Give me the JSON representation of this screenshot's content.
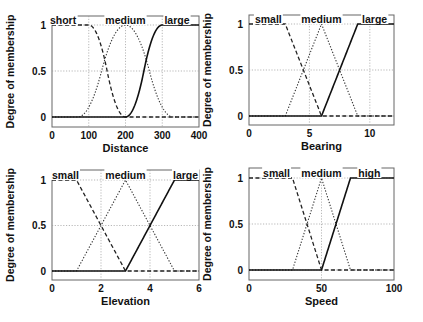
{
  "chart_data": [
    {
      "type": "line",
      "title": "",
      "xlabel": "Distance",
      "ylabel": "Degree of membership",
      "xlim": [
        0,
        400
      ],
      "ylim": [
        0,
        1
      ],
      "xticks": [
        0,
        100,
        200,
        300,
        400
      ],
      "yticks": [
        0,
        0.5,
        1
      ],
      "ytick_labels": [
        "0",
        "0.5",
        "1"
      ],
      "grid": true,
      "series": [
        {
          "name": "short",
          "style": "dashed",
          "shape": "zmf",
          "params": [
            100,
            200
          ],
          "label_x": 30
        },
        {
          "name": "medium",
          "style": "dotted",
          "shape": "gbell-like",
          "params": [
            100,
            200,
            300
          ],
          "label_x": 200
        },
        {
          "name": "large",
          "style": "solid",
          "shape": "smf",
          "params": [
            200,
            300
          ],
          "label_x": 340
        }
      ]
    },
    {
      "type": "line",
      "title": "",
      "xlabel": "Bearing",
      "ylabel": "Degree of membership",
      "xlim": [
        0,
        12
      ],
      "ylim": [
        0,
        1
      ],
      "xticks": [
        0,
        5,
        10
      ],
      "yticks": [
        0,
        0.5,
        1
      ],
      "ytick_labels": [
        "0",
        "0.5",
        "1"
      ],
      "grid": true,
      "series": [
        {
          "name": "small",
          "style": "dashed",
          "shape": "trapmf",
          "params": [
            0,
            0,
            3,
            6
          ],
          "label_x": 1.6
        },
        {
          "name": "medium",
          "style": "dotted",
          "shape": "trimf",
          "params": [
            3,
            6,
            9
          ],
          "label_x": 6
        },
        {
          "name": "large",
          "style": "solid",
          "shape": "trapmf",
          "params": [
            6,
            9,
            12,
            12
          ],
          "label_x": 10.4
        }
      ]
    },
    {
      "type": "line",
      "title": "",
      "xlabel": "Elevation",
      "ylabel": "Degree of membership",
      "xlim": [
        0,
        6
      ],
      "ylim": [
        0,
        1
      ],
      "xticks": [
        0,
        2,
        4,
        6
      ],
      "yticks": [
        0,
        0.5,
        1
      ],
      "ytick_labels": [
        "0",
        "0.5",
        "1"
      ],
      "grid": true,
      "series": [
        {
          "name": "small",
          "style": "dashed",
          "shape": "trapmf",
          "params": [
            0,
            0,
            1,
            3
          ],
          "label_x": 0.55
        },
        {
          "name": "medium",
          "style": "dotted",
          "shape": "trimf",
          "params": [
            1,
            3,
            5
          ],
          "label_x": 3
        },
        {
          "name": "large",
          "style": "solid",
          "shape": "trapmf",
          "params": [
            3,
            5,
            6,
            6
          ],
          "label_x": 5.45
        }
      ]
    },
    {
      "type": "line",
      "title": "",
      "xlabel": "Speed",
      "ylabel": "Degree of membership",
      "xlim": [
        0,
        100
      ],
      "ylim": [
        0,
        1
      ],
      "xticks": [
        0,
        50,
        100
      ],
      "yticks": [
        0,
        0.5,
        1
      ],
      "ytick_labels": [
        "0",
        "0.5",
        "1"
      ],
      "grid": true,
      "series": [
        {
          "name": "small",
          "style": "dashed",
          "shape": "trapmf",
          "params": [
            0,
            0,
            30,
            50
          ],
          "label_x": 19
        },
        {
          "name": "medium",
          "style": "dotted",
          "shape": "trimf",
          "params": [
            30,
            50,
            70
          ],
          "label_x": 50
        },
        {
          "name": "high",
          "style": "solid",
          "shape": "trapmf",
          "params": [
            50,
            70,
            100,
            100
          ],
          "label_x": 83
        }
      ]
    }
  ],
  "layout": {
    "panels": [
      {
        "box": [
          52,
          16,
          199,
          127
        ],
        "y0": 117,
        "y1": 25
      },
      {
        "box": [
          249,
          15,
          394,
          125
        ],
        "y0": 116,
        "y1": 24
      },
      {
        "box": [
          52,
          170,
          199,
          280
        ],
        "y0": 271,
        "y1": 180
      },
      {
        "box": [
          249,
          168,
          394,
          280
        ],
        "y0": 270,
        "y1": 178
      }
    ]
  }
}
